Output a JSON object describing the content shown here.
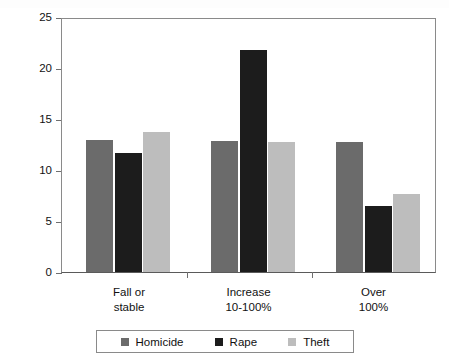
{
  "chart_data": {
    "type": "bar",
    "title": "",
    "xlabel": "",
    "ylabel": "Number of countries",
    "categories": [
      "Fall or\nstable",
      "Increase\n10-100%",
      "Over\n100%"
    ],
    "series": [
      {
        "name": "Homicide",
        "color": "#6b6b6b",
        "values": [
          12.9,
          12.8,
          12.7
        ]
      },
      {
        "name": "Rape",
        "color": "#1c1c1c",
        "values": [
          11.7,
          21.8,
          6.5
        ]
      },
      {
        "name": "Theft",
        "color": "#bdbdbd",
        "values": [
          13.7,
          12.7,
          7.6
        ]
      }
    ],
    "ylim": [
      0,
      25
    ],
    "yticks": [
      0,
      5,
      10,
      15,
      20,
      25
    ],
    "ytick_labels": [
      "0",
      "5",
      "10",
      "15",
      "20",
      "25"
    ],
    "grid": false,
    "legend_position": "bottom"
  },
  "axis": {
    "y_title": "Number of countries",
    "tick_25": "25",
    "tick_20": "20",
    "tick_15": "15",
    "tick_10": "10",
    "tick_5": "5",
    "tick_0": "0"
  },
  "groups": [
    {
      "label": "Fall or\nstable"
    },
    {
      "label": "Increase\n10-100%"
    },
    {
      "label": "Over\n100%"
    }
  ],
  "legend": {
    "items": [
      {
        "label": "Homicide",
        "color": "#6b6b6b"
      },
      {
        "label": "Rape",
        "color": "#1c1c1c"
      },
      {
        "label": "Theft",
        "color": "#bdbdbd"
      }
    ]
  }
}
